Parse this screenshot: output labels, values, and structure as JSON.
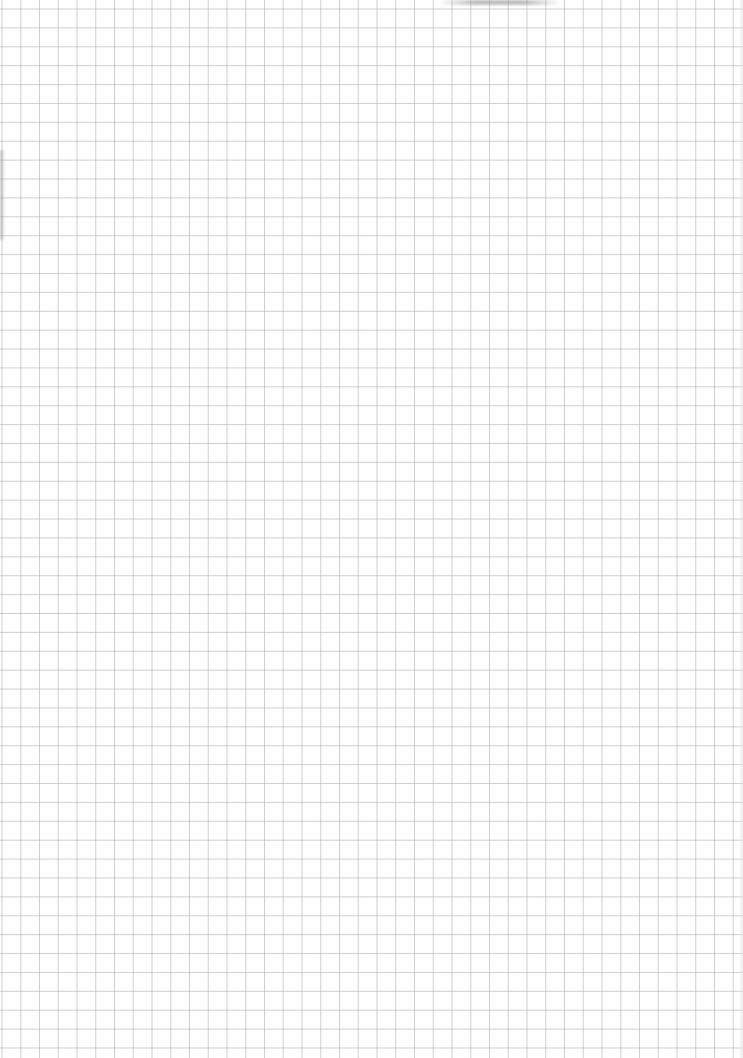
{
  "document": {
    "type": "graph-paper-sheet",
    "grid": {
      "cell_width_px": 18.75,
      "cell_height_px": 18.9,
      "line_color": "#c8c8c8",
      "background_color": "#fefefe"
    },
    "text_content": ""
  }
}
